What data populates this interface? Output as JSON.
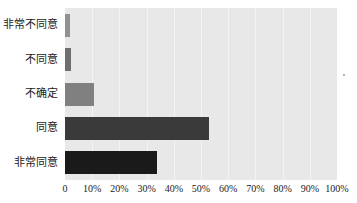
{
  "chart_data": {
    "type": "bar",
    "orientation": "horizontal",
    "title": "",
    "subtitle": "",
    "xlabel": "",
    "ylabel": "",
    "categories": [
      "非常不同意",
      "不同意",
      "不确定",
      "同意",
      "非常同意"
    ],
    "values": [
      2,
      2.3,
      10.5,
      53,
      34
    ],
    "tick_labels": [
      "0",
      "10%",
      "20%",
      "30%",
      "40%",
      "50%",
      "60%",
      "70%",
      "80%",
      "90%",
      "100%"
    ],
    "tick_values": [
      0,
      10,
      20,
      30,
      40,
      50,
      60,
      70,
      80,
      90,
      100
    ],
    "xlim": [
      0,
      100
    ],
    "grid": true,
    "gridlines_axis": "x",
    "legend": false,
    "legend_position": "none",
    "bar_colors": [
      "#919191",
      "#6f6f6f",
      "#808080",
      "#3a3a3a",
      "#1a1a1a"
    ],
    "plot_background": "#e8e8e8",
    "gridline_color": "#f4f4f4",
    "figure_background": "#ffffff",
    "annotations": []
  }
}
